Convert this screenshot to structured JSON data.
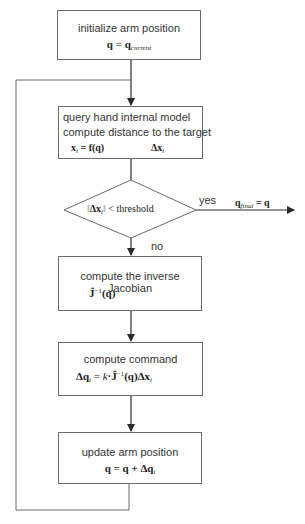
{
  "diagram": {
    "colors": {
      "line": "#2a2a2a",
      "box_border": "#6a6a6a",
      "text": "#333333"
    },
    "nodes": {
      "init": {
        "label": "initialize arm position",
        "formula": "q = q_current",
        "f_lhs": "q",
        "f_eq": " = ",
        "f_rhs": "q",
        "f_sub": "current"
      },
      "query": {
        "label1": "query hand internal model",
        "label2": "compute distance to the target",
        "f_left": "x_i = f(q)",
        "fl_a": "x",
        "fl_sub": "i",
        "fl_b": " = f(q)",
        "f_right": "Δx_i",
        "fr_a": "Δx",
        "fr_sub": "i"
      },
      "decision": {
        "formula": "‖Δx_i‖ < threshold",
        "d_open": "‖",
        "d_a": "Δx",
        "d_sub": "i",
        "d_close": "‖",
        "d_rest": " < threshold"
      },
      "jacobian": {
        "label": "compute the inverse Jacobian",
        "formula": "Ĵ^-1(q)",
        "j_a": "Ĵ",
        "j_sup": "−1",
        "j_b": "(q)"
      },
      "command": {
        "label": "compute command",
        "formula": "Δq_i = k·Ĵ^-1(q)Δx_i",
        "c_a": "Δq",
        "c_sub": "i",
        "c_b": " = ",
        "c_k": "k",
        "c_c": "·Ĵ",
        "c_sup": "−1",
        "c_d": "(q)Δx",
        "c_sub2": "i"
      },
      "update": {
        "label": "update arm position",
        "formula": "q = q + Δq_i",
        "u_a": "q = q + Δq",
        "u_sub": "i"
      }
    },
    "edges": {
      "yes_label": "yes",
      "no_label": "no",
      "output": {
        "formula": "q_final = q",
        "o_a": "q",
        "o_sub": "final",
        "o_b": " = q"
      }
    }
  }
}
